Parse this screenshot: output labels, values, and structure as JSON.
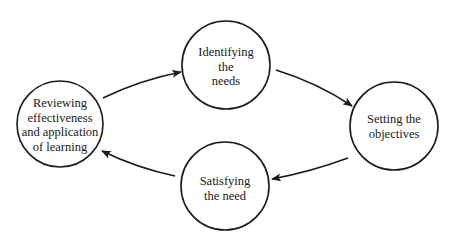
{
  "diagram": {
    "type": "cycle",
    "colors": {
      "stroke": "#1a1a1a",
      "background": "#ffffff",
      "text": "#1a1a1a"
    },
    "nodes": [
      {
        "id": "identify",
        "lines": [
          "Identifying",
          "the",
          "needs"
        ],
        "cx": 226,
        "cy": 65,
        "r": 44
      },
      {
        "id": "setting",
        "lines": [
          "Setting the",
          "objectives"
        ],
        "cx": 394,
        "cy": 126,
        "r": 44
      },
      {
        "id": "satisfy",
        "lines": [
          "Satisfying",
          "the need"
        ],
        "cx": 225,
        "cy": 186,
        "r": 44
      },
      {
        "id": "review",
        "lines": [
          "Reviewing",
          "effectiveness",
          "and application",
          "of learning"
        ],
        "cx": 60,
        "cy": 124,
        "r": 43
      }
    ],
    "edges": [
      {
        "from": "review",
        "to": "identify"
      },
      {
        "from": "identify",
        "to": "setting"
      },
      {
        "from": "setting",
        "to": "satisfy"
      },
      {
        "from": "satisfy",
        "to": "review"
      }
    ]
  }
}
